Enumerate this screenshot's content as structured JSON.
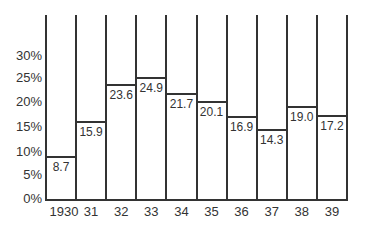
{
  "chart_data": {
    "type": "bar",
    "title": "",
    "xlabel": "",
    "ylabel": "",
    "categories": [
      "1930",
      "31",
      "32",
      "33",
      "34",
      "35",
      "36",
      "37",
      "38",
      "39"
    ],
    "values": [
      8.7,
      15.9,
      23.6,
      24.9,
      21.7,
      20.1,
      16.9,
      14.3,
      19.0,
      17.2
    ],
    "value_labels": [
      "8.7",
      "15.9",
      "23.6",
      "24.9",
      "21.7",
      "20.1",
      "16.9",
      "14.3",
      "19.0",
      "17.2"
    ],
    "y_ticks": [
      "0%",
      "5%",
      "10%",
      "15%",
      "20%",
      "25%",
      "30%"
    ],
    "ylim": [
      0,
      38
    ],
    "grid": false,
    "legend": null
  }
}
